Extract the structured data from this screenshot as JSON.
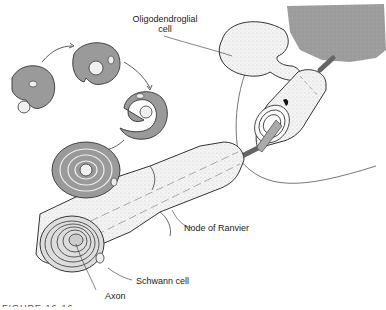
{
  "figure": {
    "labels": {
      "oligodendroglial": [
        "Oligodendroglial",
        "cell"
      ],
      "node_of_ranvier": "Node of Ranvier",
      "schwann_cell": "Schwann cell",
      "axon": "Axon"
    },
    "caption": "FIGURE 16-16",
    "colors": {
      "cell_fill": "#9a9a9a",
      "tissue_fill": "#a6a6a6",
      "tube_fill": "#f2f2f2",
      "line": "#333333"
    }
  }
}
